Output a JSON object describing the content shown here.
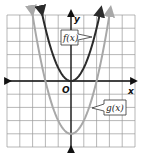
{
  "chart_data": {
    "type": "line",
    "title": "",
    "xlabel": "x",
    "ylabel": "y",
    "origin_label": "O",
    "xlim": [
      -5,
      5
    ],
    "ylim": [
      -5,
      5
    ],
    "grid": true,
    "tick_labels": false,
    "series": [
      {
        "name": "f(x)",
        "equation": "y = x^2",
        "color": "#2b2b2b",
        "vertex": [
          0,
          0
        ],
        "x": [
          -2.3,
          -2,
          -1.5,
          -1,
          -0.5,
          0,
          0.5,
          1,
          1.5,
          2,
          2.3
        ],
        "y": [
          5.29,
          4,
          2.25,
          1,
          0.25,
          0,
          0.25,
          1,
          2.25,
          4,
          5.29
        ]
      },
      {
        "name": "g(x)",
        "equation": "y = x^2 - 4",
        "color": "#a8a8a8",
        "vertex": [
          0,
          -4
        ],
        "x": [
          -3.05,
          -3,
          -2,
          -1,
          0,
          1,
          2,
          3,
          3.05
        ],
        "y": [
          5.3,
          5,
          0,
          -3,
          -4,
          -3,
          0,
          5,
          5.3
        ]
      }
    ],
    "annotations": [
      {
        "text": "f(x)",
        "points_to": "f(x) right branch"
      },
      {
        "text": "g(x)",
        "points_to": "g(x) right branch"
      }
    ]
  },
  "labels": {
    "x_axis": "x",
    "y_axis": "y",
    "origin": "O",
    "f": "f(x)",
    "g": "g(x)"
  }
}
